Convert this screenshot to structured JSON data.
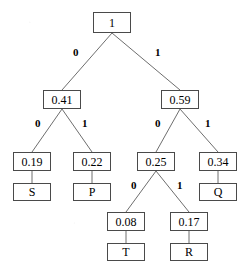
{
  "diagram": {
    "type": "binary-tree",
    "background_color": "#ffffff",
    "node_border_color": "#4a4a4a",
    "edge_color": "#6e6e6e",
    "text_color": "#000000"
  },
  "nodes": [
    {
      "id": "root",
      "label": "1",
      "kind": "weight",
      "x": 93,
      "y": 12,
      "w": 38,
      "h": 21
    },
    {
      "id": "n041",
      "label": "0.41",
      "kind": "weight",
      "x": 43,
      "y": 90,
      "w": 38,
      "h": 19
    },
    {
      "id": "n059",
      "label": "0.59",
      "kind": "weight",
      "x": 161,
      "y": 90,
      "w": 38,
      "h": 19
    },
    {
      "id": "n019",
      "label": "0.19",
      "kind": "weight",
      "x": 13,
      "y": 152,
      "w": 38,
      "h": 19
    },
    {
      "id": "n022",
      "label": "0.22",
      "kind": "weight",
      "x": 73,
      "y": 152,
      "w": 38,
      "h": 19
    },
    {
      "id": "n025",
      "label": "0.25",
      "kind": "weight",
      "x": 137,
      "y": 152,
      "w": 38,
      "h": 19
    },
    {
      "id": "n034",
      "label": "0.34",
      "kind": "weight",
      "x": 199,
      "y": 152,
      "w": 38,
      "h": 19
    },
    {
      "id": "leafS",
      "label": "S",
      "kind": "symbol",
      "x": 13,
      "y": 183,
      "w": 38,
      "h": 18
    },
    {
      "id": "leafP",
      "label": "P",
      "kind": "symbol",
      "x": 73,
      "y": 183,
      "w": 38,
      "h": 18
    },
    {
      "id": "leafQ",
      "label": "Q",
      "kind": "symbol",
      "x": 199,
      "y": 183,
      "w": 38,
      "h": 18
    },
    {
      "id": "n008",
      "label": "0.08",
      "kind": "weight",
      "x": 107,
      "y": 212,
      "w": 38,
      "h": 19
    },
    {
      "id": "n017",
      "label": "0.17",
      "kind": "weight",
      "x": 170,
      "y": 212,
      "w": 38,
      "h": 19
    },
    {
      "id": "leafT",
      "label": "T",
      "kind": "symbol",
      "x": 107,
      "y": 243,
      "w": 38,
      "h": 18
    },
    {
      "id": "leafR",
      "label": "R",
      "kind": "symbol",
      "x": 170,
      "y": 243,
      "w": 38,
      "h": 18
    }
  ],
  "edges": [
    {
      "from": "root",
      "to": "n041",
      "bit": "0",
      "x1": 112,
      "y1": 33,
      "x2": 62,
      "y2": 90,
      "label_x": 73,
      "label_y": 47
    },
    {
      "from": "root",
      "to": "n059",
      "bit": "1",
      "x1": 112,
      "y1": 33,
      "x2": 180,
      "y2": 90,
      "label_x": 155,
      "label_y": 47
    },
    {
      "from": "n041",
      "to": "n019",
      "bit": "0",
      "x1": 62,
      "y1": 109,
      "x2": 32,
      "y2": 152,
      "label_x": 35,
      "label_y": 118
    },
    {
      "from": "n041",
      "to": "n022",
      "bit": "1",
      "x1": 62,
      "y1": 109,
      "x2": 92,
      "y2": 152,
      "label_x": 82,
      "label_y": 118
    },
    {
      "from": "n059",
      "to": "n025",
      "bit": "0",
      "x1": 180,
      "y1": 109,
      "x2": 156,
      "y2": 152,
      "label_x": 155,
      "label_y": 118
    },
    {
      "from": "n059",
      "to": "n034",
      "bit": "1",
      "x1": 180,
      "y1": 109,
      "x2": 218,
      "y2": 152,
      "label_x": 205,
      "label_y": 118
    },
    {
      "from": "n019",
      "to": "leafS",
      "bit": "",
      "x1": 32,
      "y1": 171,
      "x2": 32,
      "y2": 183,
      "label_x": 0,
      "label_y": 0
    },
    {
      "from": "n022",
      "to": "leafP",
      "bit": "",
      "x1": 92,
      "y1": 171,
      "x2": 92,
      "y2": 183,
      "label_x": 0,
      "label_y": 0
    },
    {
      "from": "n034",
      "to": "leafQ",
      "bit": "",
      "x1": 218,
      "y1": 171,
      "x2": 218,
      "y2": 183,
      "label_x": 0,
      "label_y": 0
    },
    {
      "from": "n025",
      "to": "n008",
      "bit": "0",
      "x1": 156,
      "y1": 171,
      "x2": 126,
      "y2": 212,
      "label_x": 131,
      "label_y": 180
    },
    {
      "from": "n025",
      "to": "n017",
      "bit": "1",
      "x1": 156,
      "y1": 171,
      "x2": 189,
      "y2": 212,
      "label_x": 177,
      "label_y": 180
    },
    {
      "from": "n008",
      "to": "leafT",
      "bit": "",
      "x1": 126,
      "y1": 231,
      "x2": 126,
      "y2": 243,
      "label_x": 0,
      "label_y": 0
    },
    {
      "from": "n017",
      "to": "leafR",
      "bit": "",
      "x1": 189,
      "y1": 231,
      "x2": 189,
      "y2": 243,
      "label_x": 0,
      "label_y": 0
    }
  ]
}
